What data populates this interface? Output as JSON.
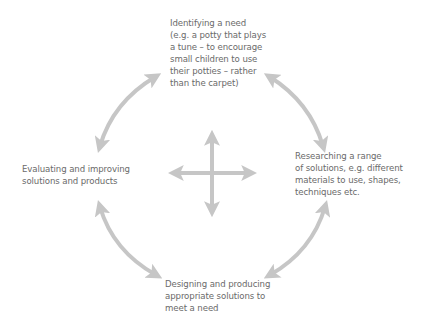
{
  "diagram": {
    "type": "cycle",
    "colors": {
      "arrow": "#c6c6c6",
      "text": "#6a6a6a",
      "background": "#ffffff"
    },
    "nodes": {
      "top": {
        "title": "Identifying a need",
        "lines": [
          "Identifying a need",
          "(e.g. a potty that plays",
          "a tune – to encourage",
          "small children to use",
          "their potties – rather",
          "than the carpet)"
        ]
      },
      "right": {
        "title": "Researching a range of solutions",
        "lines": [
          "Researching a range",
          "of solutions, e.g. different",
          "materials to use, shapes,",
          "techniques etc."
        ]
      },
      "bottom": {
        "title": "Designing and producing appropriate solutions",
        "lines": [
          "Designing and producing",
          "appropriate solutions to",
          "meet a need"
        ]
      },
      "left": {
        "title": "Evaluating and improving solutions and products",
        "lines": [
          "Evaluating and improving",
          "solutions and products"
        ]
      }
    },
    "connections": [
      {
        "from": "top",
        "to": "right",
        "style": "double-headed-curved-arrow"
      },
      {
        "from": "right",
        "to": "bottom",
        "style": "double-headed-curved-arrow"
      },
      {
        "from": "bottom",
        "to": "left",
        "style": "double-headed-curved-arrow"
      },
      {
        "from": "left",
        "to": "top",
        "style": "double-headed-curved-arrow"
      }
    ],
    "center_symbol": "four-way-arrow"
  }
}
